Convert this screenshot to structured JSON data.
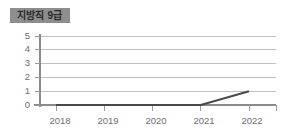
{
  "title": {
    "label": "지방직 9급"
  },
  "colors": {
    "title_box_background": "#8e8e8e",
    "title_text": "#2b2b2b",
    "grid": "#b9b9b9",
    "axis": "#8a8a8a",
    "data_line": "#4a4a4a",
    "tick_label": "#6d6d6d",
    "background": "#ffffff"
  },
  "chart_data": {
    "type": "line",
    "title": "지방직 9급",
    "xlabel": "",
    "ylabel": "",
    "categories": [
      "2018",
      "2019",
      "2020",
      "2021",
      "2022"
    ],
    "values": [
      0,
      0,
      0,
      0,
      1
    ],
    "series": [
      {
        "name": "지방직 9급",
        "values": [
          0,
          0,
          0,
          0,
          1
        ]
      }
    ],
    "ylim": [
      0,
      5
    ],
    "y_ticks": [
      0,
      1,
      2,
      3,
      4,
      5
    ],
    "y_tick_labels": [
      "0",
      "1",
      "2",
      "3",
      "4",
      "5"
    ],
    "x_tick_labels": [
      "2018",
      "2019",
      "2020",
      "2021",
      "2022"
    ],
    "grid": true,
    "grid_axis": "y",
    "legend": false,
    "legend_position": "none"
  },
  "axes": {
    "y_labels": [
      "5",
      "4",
      "3",
      "2",
      "1",
      "0"
    ],
    "x_labels": [
      "2018",
      "2019",
      "2020",
      "2021",
      "2022"
    ]
  }
}
